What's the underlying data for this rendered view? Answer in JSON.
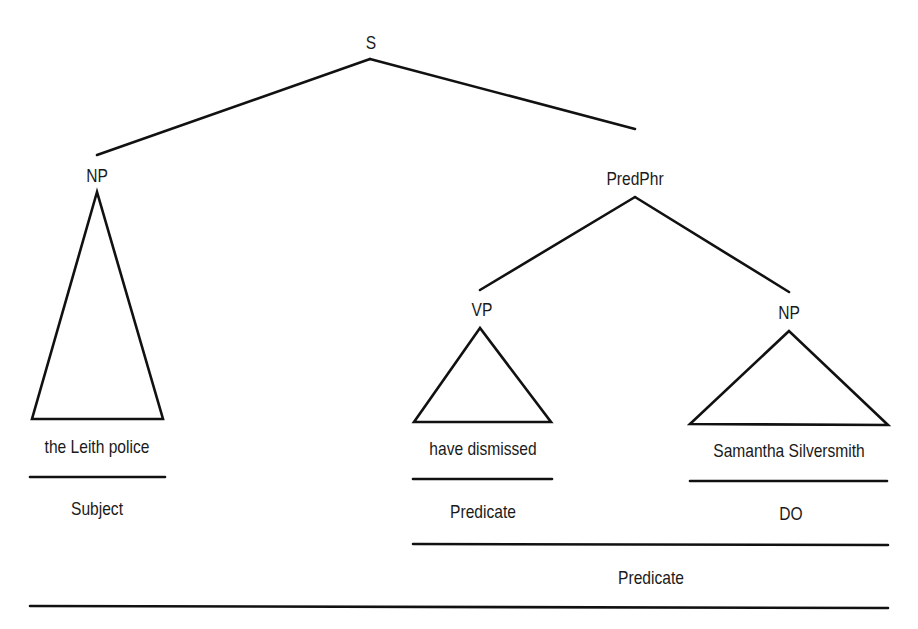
{
  "diagram": {
    "type": "syntax-tree",
    "nodes": {
      "root": "S",
      "subject_np": "NP",
      "pred_phrase": "PredPhr",
      "vp": "VP",
      "object_np": "NP"
    },
    "leaves": {
      "subject_text": "the Leith police",
      "verb_text": "have dismissed",
      "object_text": "Samantha Silversmith"
    },
    "functions": {
      "subject": "Subject",
      "verb_predicate": "Predicate",
      "direct_object": "DO",
      "full_predicate": "Predicate"
    },
    "line_color": "#111111",
    "text_color": "#1a1a1a"
  }
}
